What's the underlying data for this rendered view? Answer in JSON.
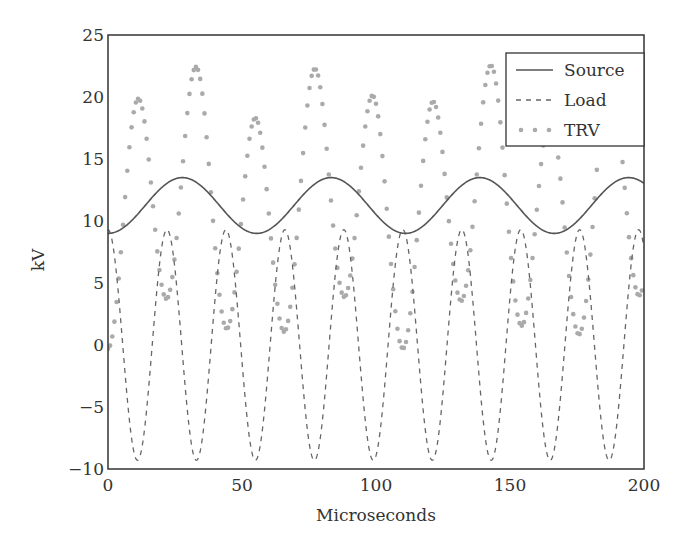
{
  "chart_data": {
    "type": "line",
    "title": "",
    "xlabel": "Microseconds",
    "ylabel": "kV",
    "xlim": [
      0,
      200
    ],
    "ylim": [
      -10,
      25
    ],
    "xticks": [
      0,
      50,
      100,
      150,
      200
    ],
    "yticks": [
      -10,
      -5,
      0,
      5,
      10,
      15,
      20,
      25
    ],
    "xtick_labels": [
      "0",
      "50",
      "100",
      "150",
      "200"
    ],
    "ytick_labels": [
      "−10",
      "−5",
      "0",
      "5",
      "10",
      "15",
      "20",
      "25"
    ],
    "grid": false,
    "legend": {
      "placement": "top-right",
      "entries": [
        "Source",
        "Load",
        "TRV"
      ]
    },
    "series": [
      {
        "name": "Source",
        "style": "solid",
        "color": "#555555",
        "model": "mean + amp*(-cos(2*pi*t/period))",
        "mean": 11.25,
        "amplitude": 2.25,
        "period_us": 55.5,
        "x": [
          0,
          14,
          28,
          42,
          55,
          69,
          83,
          97,
          111,
          125,
          139,
          153,
          166,
          180,
          194,
          200
        ],
        "values": [
          9.0,
          11.2,
          13.5,
          11.3,
          9.0,
          11.2,
          13.5,
          11.3,
          9.0,
          11.2,
          13.5,
          11.3,
          9.0,
          11.2,
          13.4,
          12.4
        ]
      },
      {
        "name": "Load",
        "style": "dashed",
        "color": "#666666",
        "model": "amp*cos(2*pi*t/period)",
        "amplitude": 9.3,
        "period_us": 22.0,
        "x": [
          0,
          11,
          22,
          33,
          44,
          55,
          66,
          77,
          88,
          99,
          110,
          121,
          132,
          143,
          154,
          165,
          176,
          187,
          198,
          200
        ],
        "values": [
          9.2,
          -9.3,
          9.2,
          -9.3,
          9.2,
          -9.3,
          9.2,
          -9.3,
          9.2,
          -9.3,
          9.2,
          -9.3,
          9.2,
          -9.3,
          9.2,
          -9.3,
          9.2,
          -9.3,
          9.2,
          8.5
        ]
      },
      {
        "name": "TRV",
        "style": "dotted",
        "color": "#aaaaaa",
        "model": "Source - Load",
        "x": [
          0,
          11,
          22,
          33,
          44,
          55,
          66,
          77,
          88,
          99,
          110,
          121,
          132,
          143,
          154,
          165,
          176,
          187,
          198
        ],
        "values": [
          0.0,
          20.0,
          2.0,
          22.3,
          2.0,
          18.3,
          2.0,
          22.0,
          2.0,
          19.8,
          0.2,
          19.5,
          2.0,
          21.8,
          2.0,
          18.4,
          2.0,
          21.5,
          3.5
        ]
      }
    ]
  }
}
